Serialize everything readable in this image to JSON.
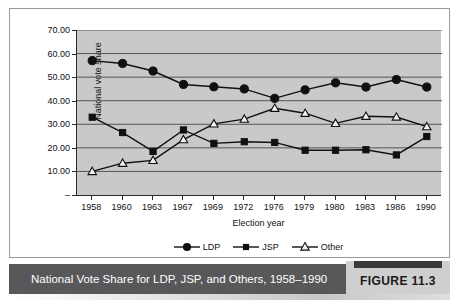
{
  "figure": {
    "caption": "National Vote Share for LDP, JSP, and Others, 1958–1990",
    "number_label": "FIGURE 11.3",
    "caption_bar_color": "#58585a",
    "caption_text_color": "#ffffff"
  },
  "chart_data": {
    "type": "line",
    "title": "",
    "xlabel": "Election year",
    "ylabel": "National vote share",
    "categories": [
      "1958",
      "1960",
      "1963",
      "1967",
      "1969",
      "1972",
      "1976",
      "1979",
      "1980",
      "1983",
      "1986",
      "1990"
    ],
    "ytick_labels": [
      "70.00",
      "60.00",
      "50.00",
      "40.00",
      "30.00",
      "20.00",
      "10.00",
      "–"
    ],
    "ytick_values": [
      70,
      60,
      50,
      40,
      30,
      20,
      10,
      0
    ],
    "ylim": [
      0,
      70
    ],
    "grid": true,
    "grid_color": "#555555",
    "plot_background": "#c9c9c9",
    "legend_position": "bottom-center",
    "series": [
      {
        "name": "LDP",
        "marker": "filled-circle",
        "color": "#101010",
        "values": [
          57.0,
          55.8,
          52.6,
          46.9,
          45.9,
          45.0,
          41.0,
          44.6,
          47.6,
          45.8,
          49.0,
          45.8
        ]
      },
      {
        "name": "JSP",
        "marker": "filled-square",
        "color": "#101010",
        "values": [
          33.0,
          26.5,
          18.5,
          27.6,
          21.9,
          22.6,
          22.3,
          19.0,
          19.0,
          19.2,
          17.0,
          24.8
        ]
      },
      {
        "name": "Other",
        "marker": "open-triangle",
        "color": "#101010",
        "values": [
          10.0,
          13.5,
          14.7,
          23.5,
          30.2,
          32.2,
          36.8,
          34.7,
          30.4,
          33.4,
          33.1,
          29.0
        ]
      }
    ]
  }
}
